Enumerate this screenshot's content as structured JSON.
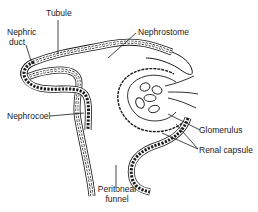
{
  "diagram": {
    "type": "anatomical-illustration",
    "colors": {
      "line": "#1a1a1a",
      "background": "#ffffff"
    },
    "labels": {
      "tubule": "Tubule",
      "nephric_duct_line1": "Nephric",
      "nephric_duct_line2": "duct",
      "nephrostome": "Nephrostome",
      "nephrocoel": "Nephrocoel",
      "glomerulus": "Glomerulus",
      "renal_capsule": "Renal capsule",
      "peritoneal_funnel_line1": "Peritoneal",
      "peritoneal_funnel_line2": "funnel"
    }
  }
}
